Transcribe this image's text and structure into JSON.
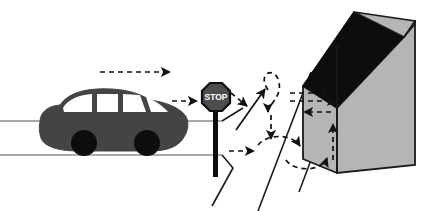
{
  "illustration": {
    "title": "Car approaching stop sign near house with movement path arrows",
    "canvas": {
      "width": 436,
      "height": 211,
      "background": "#ffffff"
    }
  },
  "colors": {
    "car_body": "#444444",
    "car_wheel": "#0d0d0d",
    "car_window": "#ffffff",
    "road_line": "#8c8c8c",
    "house_wall": "#b5b5b5",
    "house_roof": "#0d0d0d",
    "house_outline": "#1a1a1a",
    "sign_face": "#4d4d4d",
    "sign_outline": "#0d0d0d",
    "sign_post": "#0d0d0d",
    "sign_text": "#ffffff",
    "arrow": "#111111",
    "driveway_line": "#1a1a1a",
    "outline": "#000000"
  },
  "road": {
    "name": "street",
    "upper_line": {
      "x1": 0,
      "y1": 121,
      "x2": 222,
      "y2": 121
    },
    "lower_line": {
      "x1": 0,
      "y1": 155,
      "x2": 222,
      "y2": 155
    }
  },
  "car": {
    "name": "car",
    "label": "car",
    "facing": "right",
    "body_color": "#444444",
    "wheels": [
      {
        "cx": 84,
        "cy": 143,
        "r": 12
      },
      {
        "cx": 146,
        "cy": 143,
        "r": 12
      }
    ],
    "windows_count": 4
  },
  "stop_sign": {
    "name": "stop-sign",
    "text": "STOP",
    "center_x": 216,
    "center_y": 97,
    "radius": 15,
    "post": {
      "x": 214,
      "y_top": 110,
      "y_bottom": 175,
      "width": 5
    }
  },
  "house": {
    "name": "house",
    "label": "house",
    "wall_color": "#b5b5b5",
    "roof_color": "#0d0d0d",
    "front_face": {
      "x": 337,
      "y_top": 46,
      "y_bottom": 173,
      "width": 78
    },
    "has_visible_side_wall": true,
    "has_dark_roof": true
  },
  "driveway": {
    "name": "driveway",
    "lines": [
      {
        "x1": 222,
        "y1": 155,
        "x2": 232,
        "y2": 168
      },
      {
        "x1": 232,
        "y1": 168,
        "x2": 212,
        "y2": 205
      },
      {
        "x1": 310,
        "y1": 72,
        "x2": 259,
        "y2": 211
      },
      {
        "x1": 337,
        "y1": 86,
        "x2": 300,
        "y2": 190
      },
      {
        "x1": 240,
        "y1": 110,
        "x2": 222,
        "y2": 121
      }
    ]
  },
  "arrows": {
    "name": "path-arrows",
    "style": "dashed",
    "count": 12,
    "description": "dashed arrows showing the car's approach and the pedestrian/vehicle movement paths around the house entrance",
    "items": [
      {
        "name": "approach-arrow",
        "direction": "right",
        "from": [
          100,
          72
        ],
        "to": [
          172,
          72
        ]
      },
      {
        "name": "to-stop-sign-arrow",
        "direction": "right",
        "from": [
          172,
          101
        ],
        "to": [
          199,
          101
        ]
      },
      {
        "name": "past-stop-arrow",
        "direction": "right-down",
        "from": [
          230,
          95
        ],
        "to": [
          248,
          107
        ]
      },
      {
        "name": "up-left-turn-arrow",
        "direction": "up-right",
        "from": [
          237,
          128
        ],
        "to": [
          264,
          88
        ]
      },
      {
        "name": "loop-top-arrow",
        "direction": "clockwise-loop",
        "from": [
          262,
          76
        ],
        "to": [
          268,
          110
        ]
      },
      {
        "name": "down-arrow",
        "direction": "down",
        "from": [
          270,
          118
        ],
        "to": [
          270,
          140
        ]
      },
      {
        "name": "bottom-right-arrow",
        "direction": "right",
        "from": [
          232,
          150
        ],
        "to": [
          256,
          150
        ]
      },
      {
        "name": "lower-loop-arrow",
        "direction": "counterclockwise-loop",
        "from": [
          278,
          145
        ],
        "to": [
          320,
          160
        ]
      },
      {
        "name": "up-to-house-arrow",
        "direction": "up",
        "from": [
          332,
          160
        ],
        "to": [
          332,
          122
        ]
      },
      {
        "name": "left-pointing-arrow",
        "direction": "left",
        "from": [
          330,
          112
        ],
        "to": [
          303,
          112
        ]
      },
      {
        "name": "house-entry-arrow-upper",
        "direction": "right",
        "from": [
          296,
          93
        ],
        "to": [
          330,
          93
        ]
      },
      {
        "name": "house-entry-arrow-lower",
        "direction": "right",
        "from": [
          296,
          101
        ],
        "to": [
          337,
          101
        ]
      }
    ]
  }
}
